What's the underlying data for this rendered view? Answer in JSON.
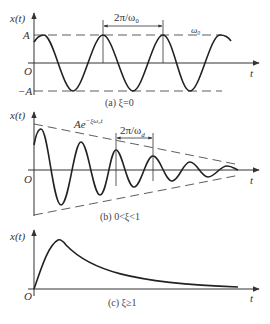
{
  "panels": [
    {
      "id": "a",
      "y_axis_label": "x(t)",
      "x_axis_label": "t",
      "origin_label": "O",
      "amplitude_pos_label": "A",
      "amplitude_neg_label": "−A",
      "period_label": "2π/ω₀",
      "frequency_label": "ω₀",
      "caption": "(a)  ξ=0",
      "description": "Undamped oscillation: constant-amplitude sinusoid between A and −A"
    },
    {
      "id": "b",
      "y_axis_label": "x(t)",
      "x_axis_label": "t",
      "origin_label": "O",
      "envelope_label": "Ae",
      "envelope_exponent": "−ξω₀t",
      "period_label": "2π/ω",
      "period_sub": "d",
      "caption": "(b)  0<ξ<1",
      "description": "Underdamped oscillation decaying within exponential envelope"
    },
    {
      "id": "c",
      "y_axis_label": "x(t)",
      "x_axis_label": "t",
      "origin_label": "O",
      "caption": "(c)  ξ≥1",
      "description": "Overdamped / critically damped: rises to a single peak then decays without oscillation"
    }
  ]
}
